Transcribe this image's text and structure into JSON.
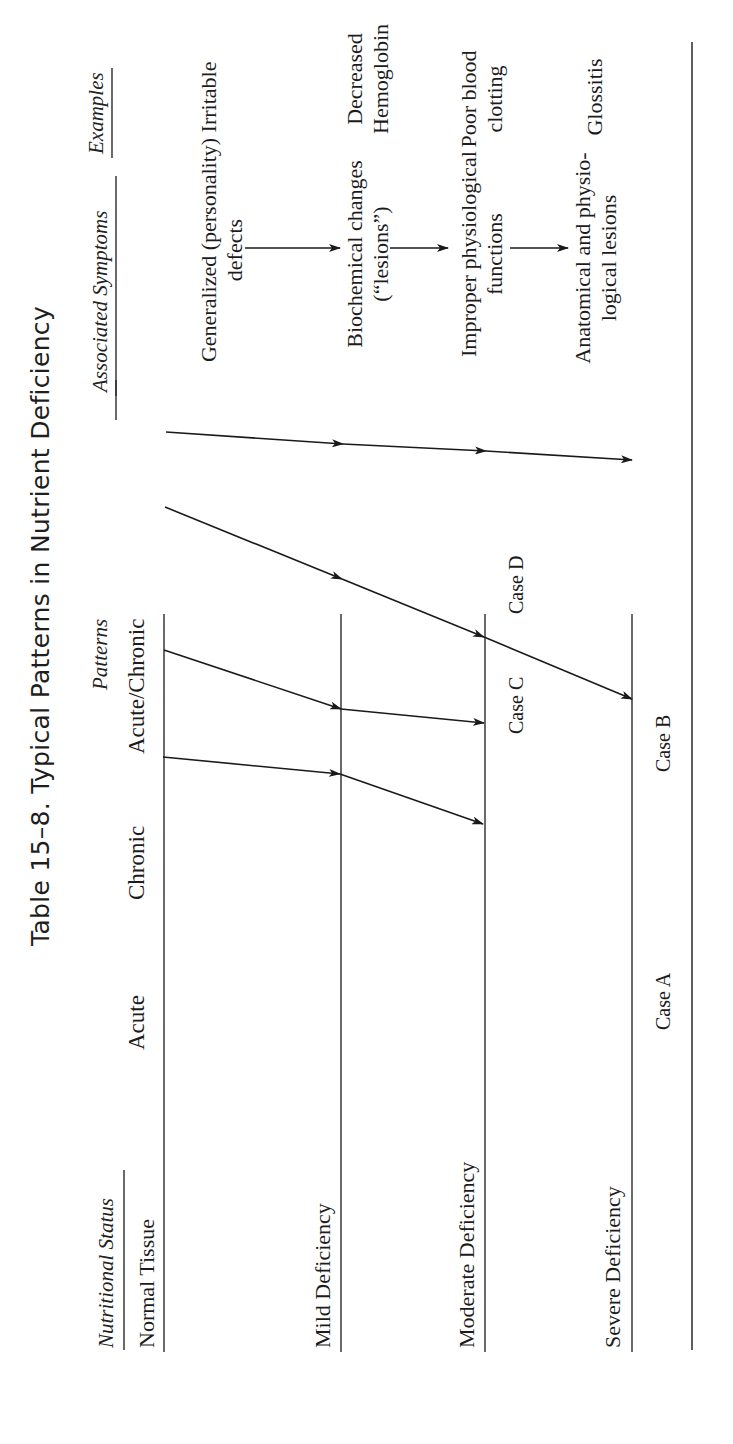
{
  "title": "Table 15–8.   Typical Patterns in Nutrient Deficiency",
  "headers": {
    "nutritional_status": "Nutritional Status",
    "patterns": "Patterns",
    "associated_symptoms": "Associated Symptoms",
    "examples": "Examples"
  },
  "patterns": {
    "acute": "Acute",
    "chronic": "Chronic",
    "acute_chronic": "Acute/Chronic"
  },
  "rows": [
    {
      "status": "Normal Tissue",
      "symptom_line1": "Generalized (personality)",
      "symptom_line2": "defects",
      "example_line1": "Irritable",
      "example_line2": ""
    },
    {
      "status": "Mild Deficiency",
      "symptom_line1": "Biochemical changes",
      "symptom_line2": "(“lesions”)",
      "example_line1": "Decreased",
      "example_line2": "Hemoglobin"
    },
    {
      "status": "Moderate Deficiency",
      "symptom_line1": "Improper physiological",
      "symptom_line2": "functions",
      "example_line1": "Poor blood",
      "example_line2": "clotting"
    },
    {
      "status": "Severe Deficiency",
      "symptom_line1": "Anatomical and physio-",
      "symptom_line2": "logical lesions",
      "example_line1": "Glossitis",
      "example_line2": ""
    }
  ],
  "cases": {
    "a": "Case A",
    "b": "Case B",
    "c": "Case C",
    "d": "Case D"
  },
  "colors": {
    "ink": "#1a1a1a",
    "rule": "#2a2a2a",
    "paper": "#ffffff"
  },
  "diagram": {
    "levels": [
      {
        "name": "normal",
        "y": 164,
        "x1": 92,
        "x2": 830
      },
      {
        "name": "mild",
        "y": 341,
        "x1": 92,
        "x2": 830
      },
      {
        "name": "moderate",
        "y": 485,
        "x1": 92,
        "x2": 830
      },
      {
        "name": "severe",
        "y": 632,
        "x1": 92,
        "x2": 830
      }
    ],
    "paths": [
      {
        "case": "A",
        "points": [
          [
            432,
            166
          ],
          [
            444,
            343
          ],
          [
            451,
            486
          ],
          [
            460,
            632
          ]
        ]
      },
      {
        "case": "B",
        "points": [
          [
            507,
            165
          ],
          [
            579,
            342
          ],
          [
            637,
            484
          ],
          [
            699,
            632
          ]
        ]
      },
      {
        "case": "C",
        "points": [
          [
            650,
            164
          ],
          [
            709,
            341
          ],
          [
            723,
            484
          ]
        ]
      },
      {
        "case": "D",
        "points": [
          [
            757,
            163
          ],
          [
            774,
            340
          ],
          [
            824,
            483
          ]
        ]
      }
    ],
    "symptom_arrows": [
      {
        "x1": 1196,
        "y1": 245,
        "x2": 1196,
        "y2": 340
      },
      {
        "x1": 1196,
        "y1": 390,
        "x2": 1196,
        "y2": 448
      },
      {
        "x1": 1196,
        "y1": 510,
        "x2": 1196,
        "y2": 568
      }
    ],
    "header_rules": [
      {
        "x1": 94,
        "x2": 274,
        "y": 124
      },
      {
        "x1": 1024,
        "x2": 1064,
        "y": 116
      },
      {
        "x1": 1048,
        "x2": 1268,
        "y": 116
      },
      {
        "x1": 1286,
        "x2": 1376,
        "y": 112
      }
    ],
    "bottom_rule": {
      "x1": 94,
      "x2": 1402,
      "y": 692
    }
  }
}
